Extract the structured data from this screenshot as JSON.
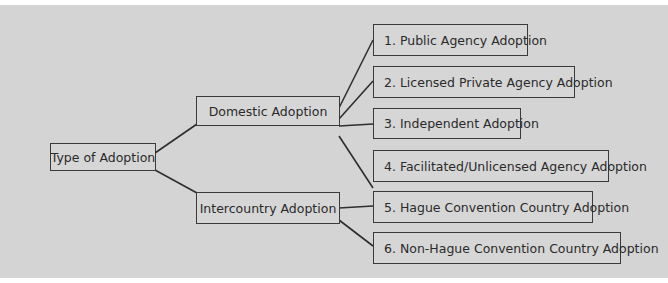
{
  "diagram": {
    "root": {
      "label": "Type of Adoption"
    },
    "branches": [
      {
        "label": "Domestic Adoption",
        "children": [
          "1. Public Agency Adoption",
          "2. Licensed Private Agency Adoption",
          "3. Independent Adoption",
          "4. Facilitated/Unlicensed Agency Adoption"
        ]
      },
      {
        "label": "Intercountry Adoption",
        "children": [
          "5. Hague Convention Country Adoption",
          "6. Non-Hague Convention Country Adoption"
        ]
      }
    ]
  },
  "colors": {
    "background": "#d4d4d4",
    "line": "#2e2e2e",
    "text": "#2a2a2a"
  }
}
